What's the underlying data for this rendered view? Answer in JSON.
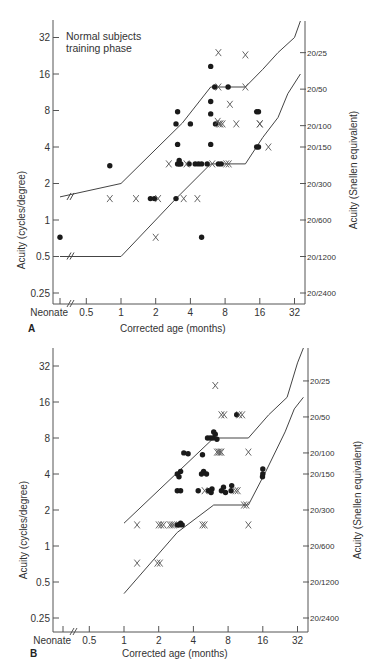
{
  "figure": {
    "panels": [
      "A",
      "B"
    ]
  },
  "chart_data": [
    {
      "panel": "A",
      "type": "scatter",
      "title": "Normal subjects training phase",
      "annotation": [
        "Normal subjects",
        "training phase"
      ],
      "xlabel": "Corrected age (months)",
      "ylabel": "Acuity (cycles/degree)",
      "ylabel_right": "Acuity (Snellen equivalent)",
      "xscale": "log2",
      "yscale": "log2",
      "x_ticks": [
        "Neonate",
        "0.5",
        "1",
        "2",
        "4",
        "8",
        "16",
        "32"
      ],
      "y_ticks": [
        "0.25",
        "0.5",
        "1",
        "2",
        "4",
        "8",
        "16",
        "32"
      ],
      "y_ticks_right": [
        "20/2400",
        "20/1200",
        "20/600",
        "20/300",
        "20/150",
        "20/100",
        "20/50",
        "20/25"
      ],
      "grid": false,
      "series": [
        {
          "name": "dot",
          "marker": "filled-circle",
          "points": [
            [
              "neonate",
              0.72
            ],
            [
              0.8,
              2.8
            ],
            [
              1.8,
              1.5
            ],
            [
              1.95,
              1.5
            ],
            [
              3.0,
              1.5
            ],
            [
              3.1,
              7.8
            ],
            [
              3.0,
              6.2
            ],
            [
              3.1,
              4.2
            ],
            [
              3.1,
              2.9
            ],
            [
              3.2,
              2.9
            ],
            [
              3.3,
              2.9
            ],
            [
              3.2,
              3.1
            ],
            [
              4.0,
              6.2
            ],
            [
              3.9,
              2.9
            ],
            [
              4.4,
              2.9
            ],
            [
              4.7,
              2.9
            ],
            [
              5.0,
              2.9
            ],
            [
              5.0,
              0.72
            ],
            [
              5.6,
              2.9
            ],
            [
              6.0,
              18.5
            ],
            [
              6.0,
              9.5
            ],
            [
              6.0,
              7.5
            ],
            [
              6.0,
              4.2
            ],
            [
              6.5,
              12.5
            ],
            [
              6.6,
              6.2
            ],
            [
              7.0,
              2.9
            ],
            [
              7.4,
              2.9
            ],
            [
              8.5,
              12.5
            ],
            [
              15.0,
              7.8
            ],
            [
              15.6,
              7.8
            ],
            [
              15.0,
              4.0
            ],
            [
              15.6,
              4.0
            ]
          ]
        },
        {
          "name": "cross",
          "marker": "x",
          "points": [
            [
              0.8,
              1.5
            ],
            [
              1.35,
              1.5
            ],
            [
              2.1,
              1.5
            ],
            [
              2.0,
              0.72
            ],
            [
              2.6,
              2.9
            ],
            [
              3.5,
              1.5
            ],
            [
              4.6,
              1.5
            ],
            [
              3.7,
              2.9
            ],
            [
              6.2,
              2.9
            ],
            [
              7.0,
              24.0
            ],
            [
              7.0,
              12.5
            ],
            [
              6.9,
              6.5
            ],
            [
              7.1,
              6.2
            ],
            [
              7.3,
              6.2
            ],
            [
              7.6,
              6.2
            ],
            [
              8.2,
              2.9
            ],
            [
              8.6,
              2.9
            ],
            [
              8.8,
              9.0
            ],
            [
              10.0,
              6.2
            ],
            [
              12.0,
              23.0
            ],
            [
              12.0,
              12.5
            ],
            [
              16.0,
              6.2
            ],
            [
              16.0,
              6.2
            ],
            [
              19.0,
              4.0
            ]
          ]
        }
      ],
      "bounds": {
        "upper": [
          [
            "neonate",
            1.55
          ],
          [
            1.0,
            2.0
          ],
          [
            3.4,
            6.3
          ],
          [
            6.0,
            12.5
          ],
          [
            12.0,
            12.5
          ],
          [
            17.0,
            17.5
          ],
          [
            23.0,
            24.0
          ],
          [
            32.0,
            32.0
          ],
          [
            36.0,
            45.0
          ]
        ],
        "lower": [
          [
            "neonate",
            0.5
          ],
          [
            1.0,
            0.5
          ],
          [
            3.0,
            1.5
          ],
          [
            6.0,
            2.9
          ],
          [
            12.0,
            2.9
          ],
          [
            17.0,
            4.8
          ],
          [
            23.0,
            7.0
          ],
          [
            28.0,
            11.0
          ],
          [
            36.0,
            16.0
          ]
        ]
      }
    },
    {
      "panel": "B",
      "type": "scatter",
      "xlabel": "Corrected age (months)",
      "ylabel": "Acuity (cycles/degree)",
      "ylabel_right": "Acuity (Snellen equivalent)",
      "xscale": "log2",
      "yscale": "log2",
      "x_ticks": [
        "Neonate",
        "0.5",
        "1",
        "2",
        "4",
        "8",
        "16",
        "32"
      ],
      "y_ticks": [
        "0.25",
        "0.5",
        "1",
        "2",
        "4",
        "8",
        "16",
        "32"
      ],
      "y_ticks_right": [
        "20/2400",
        "20/1200",
        "20/600",
        "20/300",
        "20/150",
        "20/100",
        "20/50",
        "20/25"
      ],
      "grid": false,
      "series": [
        {
          "name": "dot",
          "marker": "filled-circle",
          "points": [
            [
              2.9,
              1.5
            ],
            [
              3.0,
              1.5
            ],
            [
              3.1,
              1.55
            ],
            [
              3.2,
              1.5
            ],
            [
              2.9,
              2.9
            ],
            [
              3.1,
              2.9
            ],
            [
              3.0,
              3.8
            ],
            [
              3.1,
              4.2
            ],
            [
              2.9,
              4.0
            ],
            [
              3.3,
              6.0
            ],
            [
              3.6,
              5.9
            ],
            [
              4.4,
              2.9
            ],
            [
              4.7,
              4.0
            ],
            [
              4.9,
              4.2
            ],
            [
              5.2,
              4.0
            ],
            [
              4.8,
              5.8
            ],
            [
              5.4,
              2.9
            ],
            [
              5.7,
              2.8
            ],
            [
              5.8,
              3.0
            ],
            [
              5.3,
              8.0
            ],
            [
              5.6,
              8.0
            ],
            [
              5.9,
              8.0
            ],
            [
              6.2,
              8.6
            ],
            [
              6.4,
              7.8
            ],
            [
              6.0,
              9.0
            ],
            [
              7.0,
              2.9
            ],
            [
              7.3,
              3.1
            ],
            [
              7.6,
              2.8
            ],
            [
              8.5,
              2.9
            ],
            [
              8.6,
              3.2
            ],
            [
              9.5,
              12.5
            ],
            [
              16.0,
              4.0
            ],
            [
              16.0,
              4.4
            ],
            [
              15.9,
              3.8
            ]
          ]
        },
        {
          "name": "cross",
          "marker": "x",
          "points": [
            [
              1.3,
              1.5
            ],
            [
              1.3,
              0.72
            ],
            [
              2.0,
              1.5
            ],
            [
              2.1,
              1.5
            ],
            [
              2.2,
              1.5
            ],
            [
              1.95,
              0.72
            ],
            [
              2.05,
              0.72
            ],
            [
              2.5,
              1.5
            ],
            [
              2.6,
              1.5
            ],
            [
              2.7,
              1.5
            ],
            [
              4.8,
              1.5
            ],
            [
              5.0,
              1.5
            ],
            [
              5.0,
              2.9
            ],
            [
              6.2,
              22.0
            ],
            [
              6.4,
              6.1
            ],
            [
              6.6,
              6.1
            ],
            [
              6.8,
              6.1
            ],
            [
              7.0,
              6.1
            ],
            [
              7.0,
              12.5
            ],
            [
              7.4,
              12.5
            ],
            [
              10.0,
              12.5
            ],
            [
              10.6,
              12.5
            ],
            [
              9.3,
              2.9
            ],
            [
              9.7,
              2.9
            ],
            [
              11.0,
              2.2
            ],
            [
              11.5,
              2.2
            ],
            [
              12.0,
              6.1
            ],
            [
              12.0,
              1.5
            ]
          ]
        }
      ],
      "bounds": {
        "upper": [
          [
            1.0,
            1.55
          ],
          [
            6.0,
            8.0
          ],
          [
            12.0,
            8.0
          ],
          [
            18.0,
            12.5
          ],
          [
            26.0,
            17.5
          ],
          [
            32.0,
            34.0
          ],
          [
            36.0,
            46.0
          ]
        ],
        "lower": [
          [
            1.0,
            0.4
          ],
          [
            2.9,
            1.3
          ],
          [
            6.0,
            2.2
          ],
          [
            12.0,
            2.2
          ],
          [
            17.0,
            4.2
          ],
          [
            25.0,
            9.0
          ],
          [
            30.0,
            14.0
          ],
          [
            36.0,
            17.5
          ]
        ]
      }
    }
  ]
}
